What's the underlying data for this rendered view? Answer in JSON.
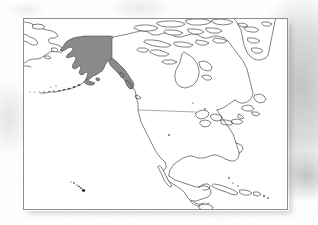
{
  "document": {
    "type": "scanned-map-figure",
    "medium": "black-and-white line map on white paper with gray scan shading",
    "width_px": 318,
    "height_px": 225
  },
  "map": {
    "title": "",
    "subject": "North America locator map",
    "projection_look": "conic / Lambert-like",
    "frame": {
      "x": 23,
      "y": 18,
      "width": 265,
      "height": 192,
      "border_color": "#8d8d8d",
      "background_color": "#ffffff"
    },
    "highlighted_region": {
      "name": "Alaska",
      "fill_color": "#8a8a8a",
      "outline_color": "#3a3a3a",
      "includes_panhandle": true
    },
    "colors": {
      "coastline": "#1a1a1a",
      "internal_border": "#555555",
      "land_fill": "#ffffff",
      "ocean_fill": "#ffffff",
      "scan_shadow": "#969696"
    },
    "features": [
      {
        "id": "alaska-mainland",
        "label": "Alaska",
        "shaded": true
      },
      {
        "id": "alaska-panhandle",
        "label": "Southeast Alaska Panhandle",
        "shaded": true
      },
      {
        "id": "aleutian-islands",
        "label": "Aleutian Islands",
        "shaded": false
      },
      {
        "id": "siberia-chukotka",
        "label": "Russian Far East",
        "shaded": false
      },
      {
        "id": "canada-mainland",
        "label": "Canada",
        "shaded": false
      },
      {
        "id": "canadian-arctic-archipelago",
        "label": "Canadian Arctic Archipelago",
        "shaded": false
      },
      {
        "id": "greenland-west",
        "label": "Greenland (west edge)",
        "shaded": false
      },
      {
        "id": "great-lakes",
        "label": "Great Lakes",
        "shaded": false
      },
      {
        "id": "hudson-bay",
        "label": "Hudson Bay",
        "shaded": false
      },
      {
        "id": "united-states",
        "label": "Contiguous United States",
        "shaded": false
      },
      {
        "id": "usa-canada-border",
        "label": "United States - Canada border",
        "shaded": false
      },
      {
        "id": "mexico",
        "label": "Mexico",
        "shaded": false
      },
      {
        "id": "baja-california",
        "label": "Baja California",
        "shaded": false
      },
      {
        "id": "central-america",
        "label": "Central America",
        "shaded": false
      },
      {
        "id": "cuba",
        "label": "Cuba",
        "shaded": false
      },
      {
        "id": "hispaniola",
        "label": "Hispaniola",
        "shaded": false
      },
      {
        "id": "newfoundland",
        "label": "Newfoundland",
        "shaded": false
      },
      {
        "id": "hawaii",
        "label": "Hawaiian Islands",
        "shaded": false
      }
    ]
  }
}
